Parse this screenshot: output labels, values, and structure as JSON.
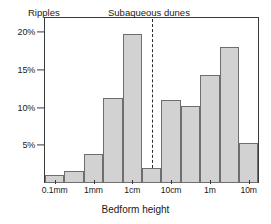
{
  "chart_data": {
    "type": "bar",
    "title": "",
    "xlabel": "Bedform height",
    "ylabel": "",
    "grid": false,
    "legend_position": "none",
    "ylim": [
      0,
      22
    ],
    "ytick_labels": [
      "5%",
      "10%",
      "15%",
      "20%"
    ],
    "ytick_values": [
      5,
      10,
      15,
      20
    ],
    "xtick_labels": [
      "0.1mm",
      "1mm",
      "1cm",
      "10cm",
      "1m",
      "10m"
    ],
    "categories": [
      "0.1mm",
      "0.3mm",
      "1mm",
      "3mm",
      "1cm",
      "3cm",
      "10cm",
      "30cm",
      "1m",
      "3m",
      "10m"
    ],
    "values": [
      1.0,
      1.6,
      3.8,
      11.3,
      19.8,
      2.0,
      11.0,
      10.2,
      14.3,
      18.0,
      5.3
    ],
    "annotations": [
      {
        "text": "Ripples",
        "region": "left"
      },
      {
        "text": "Subaqueous dunes",
        "region": "right"
      }
    ],
    "divider": {
      "label": "10cm boundary",
      "style": "dashed"
    },
    "colors": {
      "bar_fill": "#d2d2d2",
      "bar_stroke": "#6e6e6e",
      "axis": "#3a3a3a",
      "text": "#1a1a1a",
      "divider": "#2b2b2b"
    }
  },
  "figure": {
    "xaxis_title": "Bedform height",
    "region_left": "Ripples",
    "region_right": "Subaqueous dunes"
  }
}
